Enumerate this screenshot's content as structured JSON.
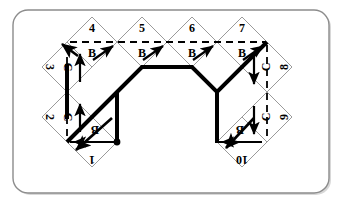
{
  "figure": {
    "frame": {
      "shape": "rounded-rectangle",
      "x": 13,
      "y": 10,
      "width": 316,
      "height": 183,
      "corner_radius": 15,
      "stroke": "#8c8c8c",
      "fill": "#ffffff"
    },
    "colors": {
      "background": "#ffffff",
      "diamond_outline": "#9a9a9a",
      "dashed_line": "#000000",
      "thick_path": "#000000",
      "label_text": "#000000",
      "arrow": "#000000",
      "dot": "#000000",
      "frame_stroke": "#8c8c8c"
    },
    "geometry": {
      "cell_half_width": 25,
      "cell_half_height": 25,
      "top_row_centers_x": [
        92,
        142,
        192,
        242
      ],
      "top_row_center_y": 42,
      "left_column_center_x": 67,
      "right_column_center_x": 267,
      "left_column_centers_y": [
        67,
        117
      ],
      "right_column_centers_y": [
        67,
        117
      ],
      "bottom_left_center": [
        92,
        142
      ],
      "bottom_right_center": [
        242,
        142
      ]
    }
  },
  "cells": [
    {
      "id": "cell-1",
      "number": "1",
      "cx": 92,
      "cy": 142,
      "number_rotation": 180,
      "marker": "B",
      "marker_rotation": 180,
      "has_dot": true,
      "dash_axis": "horizontal",
      "arrow": "left",
      "arrow_style": "straight"
    },
    {
      "id": "cell-2",
      "number": "2",
      "cx": 67,
      "cy": 117,
      "number_rotation": 90,
      "marker": "C",
      "marker_rotation": 90,
      "has_dot": false,
      "dash_axis": "vertical",
      "arrow": "up",
      "arrow_style": "straight"
    },
    {
      "id": "cell-3",
      "number": "3",
      "cx": 67,
      "cy": 67,
      "number_rotation": 90,
      "marker": "C",
      "marker_rotation": 90,
      "has_dot": false,
      "dash_axis": "vertical",
      "arrow": "up",
      "arrow_style": "straight"
    },
    {
      "id": "cell-4",
      "number": "4",
      "cx": 92,
      "cy": 42,
      "number_rotation": 0,
      "marker": "B",
      "marker_rotation": 0,
      "has_dot": false,
      "dash_axis": "horizontal",
      "arrow": "up-right",
      "arrow_style": "diagonal"
    },
    {
      "id": "cell-5",
      "number": "5",
      "cx": 142,
      "cy": 42,
      "number_rotation": 0,
      "marker": "B",
      "marker_rotation": 0,
      "has_dot": false,
      "dash_axis": "horizontal",
      "arrow": "up-right",
      "arrow_style": "diagonal"
    },
    {
      "id": "cell-6",
      "number": "6",
      "cx": 192,
      "cy": 42,
      "number_rotation": 0,
      "marker": "B",
      "marker_rotation": 0,
      "has_dot": false,
      "dash_axis": "horizontal",
      "arrow": "up-right",
      "arrow_style": "diagonal"
    },
    {
      "id": "cell-7",
      "number": "7",
      "cx": 242,
      "cy": 42,
      "number_rotation": 0,
      "marker": "B",
      "marker_rotation": 0,
      "has_dot": false,
      "dash_axis": "horizontal",
      "arrow": "up-right",
      "arrow_style": "diagonal"
    },
    {
      "id": "cell-8",
      "number": "8",
      "cx": 267,
      "cy": 67,
      "number_rotation": 270,
      "marker": "C",
      "marker_rotation": 270,
      "has_dot": false,
      "dash_axis": "vertical",
      "arrow": "down",
      "arrow_style": "straight"
    },
    {
      "id": "cell-9",
      "number": "9",
      "cx": 267,
      "cy": 117,
      "number_rotation": 270,
      "marker": "C",
      "marker_rotation": 270,
      "has_dot": false,
      "dash_axis": "vertical",
      "arrow": "down",
      "arrow_style": "straight"
    },
    {
      "id": "cell-10",
      "number": "10",
      "cx": 242,
      "cy": 142,
      "number_rotation": 180,
      "marker": "B",
      "marker_rotation": 180,
      "has_dot": false,
      "dash_axis": "horizontal",
      "arrow": "left",
      "arrow_style": "straight"
    }
  ],
  "dashed_guides": [
    {
      "id": "dash-top-row",
      "from": [
        67,
        42
      ],
      "to": [
        267,
        42
      ]
    },
    {
      "id": "dash-left-col",
      "from": [
        67,
        42
      ],
      "to": [
        67,
        142
      ]
    },
    {
      "id": "dash-right-col",
      "from": [
        267,
        42
      ],
      "to": [
        267,
        142
      ]
    },
    {
      "id": "dash-bottom-left",
      "from": [
        67,
        142
      ],
      "to": [
        117,
        142
      ]
    },
    {
      "id": "dash-bottom-right",
      "from": [
        217,
        142
      ],
      "to": [
        267,
        142
      ]
    }
  ],
  "thick_path": {
    "id": "arch-path",
    "stroke_width": 4,
    "points": [
      [
        67,
        142
      ],
      [
        117,
        92
      ],
      [
        142,
        67
      ],
      [
        192,
        67
      ],
      [
        217,
        92
      ],
      [
        267,
        42
      ]
    ]
  },
  "thick_path_extra": [
    {
      "id": "thick-left-vertical",
      "from": [
        117,
        92
      ],
      "to": [
        117,
        142
      ]
    },
    {
      "id": "thick-right-vertical",
      "from": [
        217,
        92
      ],
      "to": [
        217,
        142
      ]
    },
    {
      "id": "thick-left-riser",
      "from": [
        67,
        67
      ],
      "to": [
        67,
        117
      ]
    }
  ],
  "dot_marker": {
    "id": "start-dot",
    "cx": 117,
    "cy": 142,
    "r": 3
  }
}
